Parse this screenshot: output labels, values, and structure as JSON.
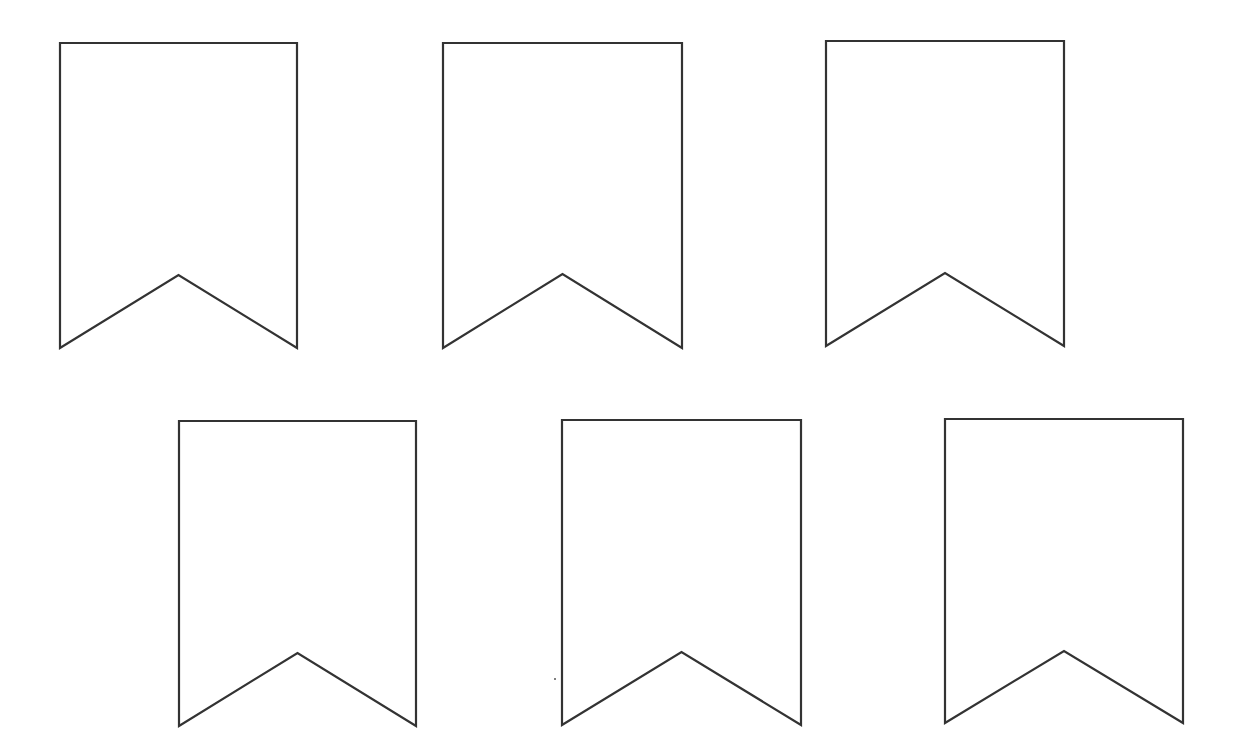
{
  "page": {
    "width": 1233,
    "height": 750,
    "background": "#ffffff"
  },
  "style": {
    "stroke_color": "#333333",
    "fill_color": "#ffffff"
  },
  "banners": [
    {
      "id": 1,
      "row": 1,
      "x": 60,
      "y": 43,
      "width": 237,
      "height": 305,
      "notch_apex_y": 275
    },
    {
      "id": 2,
      "row": 1,
      "x": 443,
      "y": 43,
      "width": 239,
      "height": 305,
      "notch_apex_y": 274
    },
    {
      "id": 3,
      "row": 1,
      "x": 826,
      "y": 41,
      "width": 238,
      "height": 305,
      "notch_apex_y": 273
    },
    {
      "id": 4,
      "row": 2,
      "x": 179,
      "y": 421,
      "width": 237,
      "height": 305,
      "notch_apex_y": 653
    },
    {
      "id": 5,
      "row": 2,
      "x": 562,
      "y": 420,
      "width": 239,
      "height": 305,
      "notch_apex_y": 652
    },
    {
      "id": 6,
      "row": 2,
      "x": 945,
      "y": 419,
      "width": 238,
      "height": 304,
      "notch_apex_y": 651
    }
  ],
  "artifacts": [
    {
      "type": "speck",
      "x": 555,
      "y": 679
    }
  ]
}
